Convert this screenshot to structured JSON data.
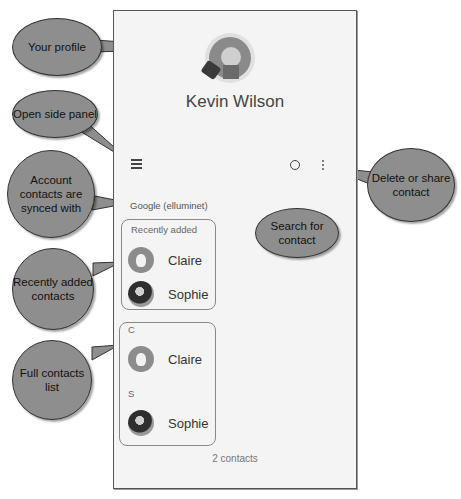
{
  "profile": {
    "name": "Kevin Wilson",
    "avatar_icon": "lion-avatar-icon"
  },
  "toolbar": {
    "menu_icon": "hamburger-menu-icon",
    "search_icon": "search-icon",
    "more_icon": "more-vert-icon"
  },
  "account": {
    "label": "Google (elluminet)"
  },
  "recently_added": {
    "header": "Recently added",
    "contacts": [
      {
        "name": "Claire",
        "avatar": "claire-avatar-icon"
      },
      {
        "name": "Sophie",
        "avatar": "sophie-penguin-avatar-icon"
      }
    ]
  },
  "full_list": {
    "sections": [
      {
        "letter": "C",
        "contacts": [
          {
            "name": "Claire",
            "avatar": "claire-avatar-icon"
          }
        ]
      },
      {
        "letter": "S",
        "contacts": [
          {
            "name": "Sophie",
            "avatar": "sophie-penguin-avatar-icon"
          }
        ]
      }
    ]
  },
  "footer": {
    "count": "2 contacts"
  },
  "callouts": {
    "your_profile": "Your profile",
    "open_side_panel": "Open side panel",
    "account_synced": "Account contacts are synced with",
    "recently_added": "Recently added contacts",
    "full_list": "Full contacts list",
    "search": "Search for contact",
    "delete_share": "Delete or share contact"
  },
  "colors": {
    "callout_fill": "#8e8e8e",
    "screen_bg": "#f4f4f4",
    "highlight_border": "#888888"
  }
}
